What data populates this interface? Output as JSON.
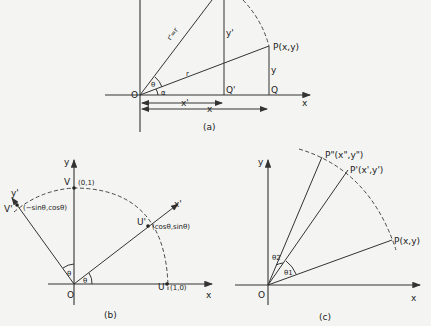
{
  "figure_a": {
    "caption": "(a)",
    "origin": "O",
    "x_axis": "x",
    "point_P": "P(x,y)",
    "point_Q": "Q",
    "point_Q_prime": "Q'",
    "y_len": "y",
    "y_prime_len": "y'",
    "x_len": "x",
    "x_prime_len": "x'",
    "r_label": "r",
    "r_prime_label": "r'=r",
    "theta": "θ",
    "alpha": "α"
  },
  "figure_b": {
    "caption": "(b)",
    "origin": "O",
    "x_axis": "x",
    "y_axis": "y",
    "x_prime_axis": "x'",
    "y_prime_axis": "y'",
    "point_V": "V",
    "point_V_coords": "(0,1)",
    "point_U": "U",
    "point_U_coords": "(1,0)",
    "point_U_prime": "U'",
    "point_U_prime_coords": "(cosθ,sinθ)",
    "point_V_prime": "V'",
    "point_V_prime_coords": "(−sinθ,cosθ)",
    "theta_1": "θ",
    "theta_2": "θ"
  },
  "figure_c": {
    "caption": "(c)",
    "origin": "O",
    "x_axis": "x",
    "y_axis": "y",
    "point_P": "P(x,y)",
    "point_P_prime": "P'(x',y')",
    "point_P_double_prime": "P\"(x\",y\")",
    "theta_1": "θ1",
    "theta_2": "θ2"
  }
}
